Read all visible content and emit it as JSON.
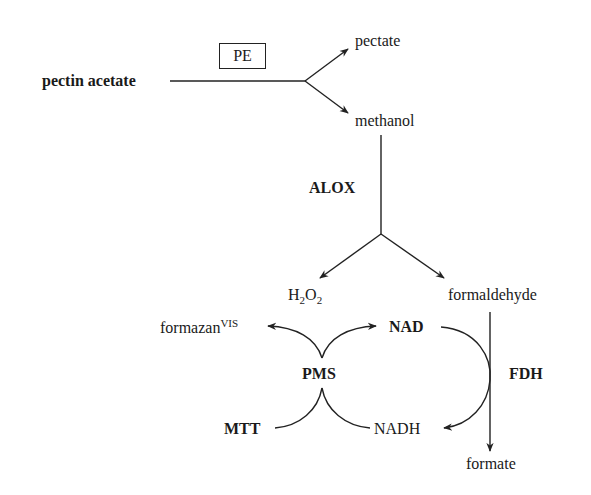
{
  "diagram": {
    "type": "biochemical-pathway",
    "nodes": {
      "pectin_acetate": "pectin acetate",
      "pectate": "pectate",
      "methanol": "methanol",
      "h2o2": {
        "main": "H",
        "sub1": "2",
        "mid": "O",
        "sub2": "2"
      },
      "formaldehyde": "formaldehyde",
      "formazan": {
        "main": "formazan",
        "sup": "VIS"
      },
      "nad": "NAD",
      "pms": "PMS",
      "mtt": "MTT",
      "nadh": "NADH",
      "formate": "formate"
    },
    "enzymes": {
      "pe": "PE",
      "alox": "ALOX",
      "fdh": "FDH"
    },
    "edges": [
      {
        "from": "pectin acetate",
        "to": "pectate",
        "enzyme": "PE"
      },
      {
        "from": "pectin acetate",
        "to": "methanol",
        "enzyme": "PE"
      },
      {
        "from": "methanol",
        "to": "H2O2",
        "enzyme": "ALOX"
      },
      {
        "from": "methanol",
        "to": "formaldehyde",
        "enzyme": "ALOX"
      },
      {
        "from": "formaldehyde",
        "to": "formate",
        "enzyme": "FDH"
      },
      {
        "from": "NAD",
        "to": "NADH",
        "enzyme": "FDH"
      },
      {
        "from": "NADH",
        "to": "NAD",
        "via": "PMS"
      },
      {
        "from": "MTT",
        "to": "formazanVIS",
        "via": "PMS"
      }
    ],
    "colors": {
      "ink": "#1a1a1a",
      "background": "#ffffff"
    }
  }
}
